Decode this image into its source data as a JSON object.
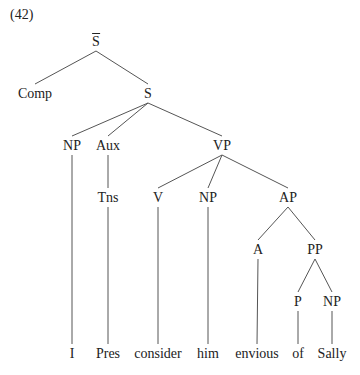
{
  "example_number": "(42)",
  "tree": {
    "nodes": [
      {
        "id": "sbar",
        "label": "S",
        "overbar": true,
        "x": 96,
        "y": 42
      },
      {
        "id": "comp",
        "label": "Comp",
        "x": 35,
        "y": 94
      },
      {
        "id": "s",
        "label": "S",
        "x": 148,
        "y": 94
      },
      {
        "id": "np1",
        "label": "NP",
        "x": 72,
        "y": 146
      },
      {
        "id": "aux",
        "label": "Aux",
        "x": 108,
        "y": 146
      },
      {
        "id": "vp",
        "label": "VP",
        "x": 222,
        "y": 146
      },
      {
        "id": "tns",
        "label": "Tns",
        "x": 108,
        "y": 198
      },
      {
        "id": "v",
        "label": "V",
        "x": 158,
        "y": 198
      },
      {
        "id": "np2",
        "label": "NP",
        "x": 208,
        "y": 198
      },
      {
        "id": "ap",
        "label": "AP",
        "x": 288,
        "y": 198
      },
      {
        "id": "a",
        "label": "A",
        "x": 258,
        "y": 250
      },
      {
        "id": "pp",
        "label": "PP",
        "x": 315,
        "y": 250
      },
      {
        "id": "p",
        "label": "P",
        "x": 298,
        "y": 302
      },
      {
        "id": "np3",
        "label": "NP",
        "x": 332,
        "y": 302
      },
      {
        "id": "w_i",
        "label": "I",
        "x": 72,
        "y": 354
      },
      {
        "id": "w_pres",
        "label": "Pres",
        "x": 108,
        "y": 354
      },
      {
        "id": "w_consider",
        "label": "consider",
        "x": 158,
        "y": 354
      },
      {
        "id": "w_him",
        "label": "him",
        "x": 208,
        "y": 354
      },
      {
        "id": "w_envious",
        "label": "envious",
        "x": 257,
        "y": 354
      },
      {
        "id": "w_of",
        "label": "of",
        "x": 298,
        "y": 354
      },
      {
        "id": "w_sally",
        "label": "Sally",
        "x": 332,
        "y": 354
      }
    ],
    "edges": [
      [
        "sbar",
        "comp"
      ],
      [
        "sbar",
        "s"
      ],
      [
        "s",
        "np1"
      ],
      [
        "s",
        "aux"
      ],
      [
        "s",
        "vp"
      ],
      [
        "np1",
        "w_i"
      ],
      [
        "aux",
        "tns"
      ],
      [
        "tns",
        "w_pres"
      ],
      [
        "vp",
        "v"
      ],
      [
        "vp",
        "np2"
      ],
      [
        "vp",
        "ap"
      ],
      [
        "v",
        "w_consider"
      ],
      [
        "np2",
        "w_him"
      ],
      [
        "ap",
        "a"
      ],
      [
        "ap",
        "pp"
      ],
      [
        "a",
        "w_envious"
      ],
      [
        "pp",
        "p"
      ],
      [
        "pp",
        "np3"
      ],
      [
        "p",
        "w_of"
      ],
      [
        "np3",
        "w_sally"
      ]
    ]
  }
}
